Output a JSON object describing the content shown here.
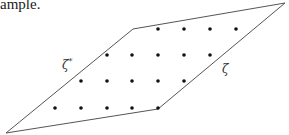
{
  "caption": "ample.",
  "diagram": {
    "stroke_color": "#555555",
    "dot_color": "#111111",
    "polygon": [
      [
        6,
        133
      ],
      [
        133,
        29
      ],
      [
        285,
        3
      ],
      [
        158,
        109
      ]
    ],
    "edge_labels": {
      "left": {
        "symbol": "ζ",
        "superscript": "*"
      },
      "right": {
        "symbol": "ζ",
        "superscript": ""
      }
    },
    "dots": [
      [
        158,
        29
      ],
      [
        184,
        29
      ],
      [
        210,
        29
      ],
      [
        236,
        29
      ],
      [
        107,
        55
      ],
      [
        132,
        55
      ],
      [
        158,
        55
      ],
      [
        184,
        55
      ],
      [
        210,
        55
      ],
      [
        81,
        81
      ],
      [
        107,
        81
      ],
      [
        132,
        81
      ],
      [
        158,
        81
      ],
      [
        184,
        81
      ],
      [
        55,
        108
      ],
      [
        81,
        108
      ],
      [
        107,
        108
      ],
      [
        132,
        108
      ],
      [
        158,
        108
      ]
    ]
  }
}
